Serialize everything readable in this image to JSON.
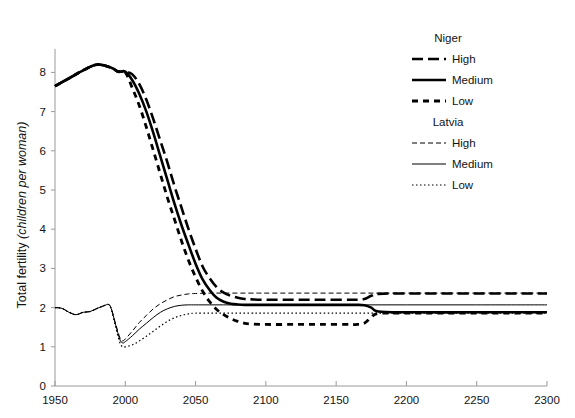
{
  "chart_data": {
    "type": "line",
    "title": "",
    "xlabel": "",
    "ylabel_main": "Total fertility ",
    "ylabel_italic": "(children per woman)",
    "xlim": [
      1950,
      2300
    ],
    "ylim": [
      0,
      8.6
    ],
    "xticks": [
      "1950",
      "2000",
      "2050",
      "2100",
      "2150",
      "2200",
      "2250",
      "2300"
    ],
    "xtick_values": [
      1950,
      2000,
      2050,
      2100,
      2150,
      2200,
      2250,
      2300
    ],
    "yticks": [
      "0",
      "1",
      "2",
      "3",
      "4",
      "5",
      "6",
      "7",
      "8"
    ],
    "ytick_values": [
      0,
      1,
      2,
      3,
      4,
      5,
      6,
      7,
      8
    ],
    "grid": false,
    "legend_position": "top-right",
    "series": [
      {
        "name": "Niger High",
        "group": "Niger",
        "variant": "High",
        "style": "long-dash-thick",
        "color": "#000000",
        "width": 2.6,
        "dash": "11 5",
        "x": [
          1950,
          1960,
          1970,
          1980,
          1990,
          1995,
          2000,
          2005,
          2010,
          2015,
          2020,
          2025,
          2030,
          2035,
          2040,
          2045,
          2050,
          2055,
          2060,
          2065,
          2070,
          2075,
          2080,
          2085,
          2090,
          2100,
          2120,
          2140,
          2160,
          2165,
          2170,
          2175,
          2180,
          2200,
          2250,
          2300
        ],
        "y": [
          7.65,
          7.85,
          8.05,
          8.2,
          8.12,
          8.02,
          8.02,
          7.95,
          7.7,
          7.3,
          6.8,
          6.25,
          5.7,
          5.1,
          4.55,
          4.0,
          3.5,
          3.05,
          2.75,
          2.52,
          2.38,
          2.3,
          2.25,
          2.22,
          2.21,
          2.2,
          2.2,
          2.2,
          2.2,
          2.2,
          2.22,
          2.3,
          2.35,
          2.36,
          2.36,
          2.36
        ]
      },
      {
        "name": "Niger Medium",
        "group": "Niger",
        "variant": "Medium",
        "style": "solid-thick",
        "color": "#000000",
        "width": 2.6,
        "dash": "none",
        "x": [
          1950,
          1960,
          1970,
          1980,
          1990,
          1995,
          2000,
          2005,
          2010,
          2015,
          2020,
          2025,
          2030,
          2035,
          2040,
          2045,
          2050,
          2055,
          2060,
          2065,
          2070,
          2075,
          2080,
          2085,
          2090,
          2100,
          2120,
          2140,
          2160,
          2165,
          2170,
          2175,
          2180,
          2200,
          2250,
          2300
        ],
        "y": [
          7.65,
          7.85,
          8.05,
          8.2,
          8.12,
          8.02,
          8.02,
          7.8,
          7.45,
          7.0,
          6.45,
          5.85,
          5.25,
          4.65,
          4.1,
          3.6,
          3.12,
          2.72,
          2.45,
          2.25,
          2.15,
          2.1,
          2.08,
          2.07,
          2.07,
          2.07,
          2.07,
          2.07,
          2.07,
          2.07,
          2.06,
          2.0,
          1.9,
          1.88,
          1.88,
          1.88
        ]
      },
      {
        "name": "Niger Low",
        "group": "Niger",
        "variant": "Low",
        "style": "short-dash-thick",
        "color": "#000000",
        "width": 2.8,
        "dash": "6 5",
        "x": [
          1950,
          1960,
          1970,
          1980,
          1990,
          1995,
          2000,
          2005,
          2010,
          2015,
          2020,
          2025,
          2030,
          2035,
          2040,
          2045,
          2050,
          2055,
          2060,
          2065,
          2070,
          2075,
          2080,
          2085,
          2090,
          2100,
          2120,
          2140,
          2160,
          2165,
          2170,
          2175,
          2180,
          2200,
          2250,
          2300
        ],
        "y": [
          7.65,
          7.85,
          8.05,
          8.2,
          8.12,
          8.02,
          8.0,
          7.6,
          7.15,
          6.6,
          6.0,
          5.4,
          4.8,
          4.25,
          3.7,
          3.2,
          2.78,
          2.42,
          2.15,
          1.95,
          1.82,
          1.72,
          1.65,
          1.6,
          1.58,
          1.57,
          1.57,
          1.57,
          1.57,
          1.57,
          1.6,
          1.75,
          1.85,
          1.86,
          1.86,
          1.86
        ]
      },
      {
        "name": "Latvia High",
        "group": "Latvia",
        "variant": "High",
        "style": "dash-thin",
        "color": "#000000",
        "width": 1.0,
        "dash": "5 3",
        "x": [
          1950,
          1955,
          1960,
          1965,
          1970,
          1975,
          1980,
          1985,
          1988,
          1990,
          1993,
          1996,
          1998,
          2000,
          2005,
          2010,
          2015,
          2020,
          2025,
          2030,
          2035,
          2040,
          2045,
          2050,
          2060,
          2070,
          2080,
          2090,
          2100,
          2150,
          2200,
          2250,
          2300
        ],
        "y": [
          2.0,
          1.98,
          1.88,
          1.82,
          1.88,
          1.9,
          1.98,
          2.05,
          2.08,
          1.98,
          1.6,
          1.25,
          1.15,
          1.2,
          1.4,
          1.62,
          1.8,
          1.97,
          2.1,
          2.2,
          2.28,
          2.32,
          2.35,
          2.36,
          2.37,
          2.37,
          2.37,
          2.37,
          2.37,
          2.37,
          2.37,
          2.37,
          2.37
        ]
      },
      {
        "name": "Latvia Medium",
        "group": "Latvia",
        "variant": "Medium",
        "style": "solid-thin",
        "color": "#000000",
        "width": 1.0,
        "dash": "none",
        "x": [
          1950,
          1955,
          1960,
          1965,
          1970,
          1975,
          1980,
          1985,
          1988,
          1990,
          1993,
          1996,
          1998,
          2000,
          2005,
          2010,
          2015,
          2020,
          2025,
          2030,
          2035,
          2040,
          2045,
          2050,
          2060,
          2070,
          2080,
          2090,
          2100,
          2150,
          2200,
          2250,
          2300
        ],
        "y": [
          2.0,
          1.98,
          1.88,
          1.82,
          1.88,
          1.9,
          1.98,
          2.05,
          2.08,
          1.98,
          1.58,
          1.2,
          1.1,
          1.13,
          1.28,
          1.45,
          1.6,
          1.75,
          1.88,
          1.97,
          2.03,
          2.06,
          2.07,
          2.07,
          2.07,
          2.07,
          2.07,
          2.07,
          2.07,
          2.07,
          2.07,
          2.07,
          2.07
        ]
      },
      {
        "name": "Latvia Low",
        "group": "Latvia",
        "variant": "Low",
        "style": "dotted-thin",
        "color": "#000000",
        "width": 1.2,
        "dash": "1.5 2.5",
        "x": [
          1950,
          1955,
          1960,
          1965,
          1970,
          1975,
          1980,
          1985,
          1988,
          1990,
          1993,
          1996,
          1998,
          2000,
          2005,
          2010,
          2015,
          2020,
          2025,
          2030,
          2035,
          2040,
          2045,
          2050,
          2060,
          2070,
          2080,
          2090,
          2100,
          2150,
          2200,
          2250,
          2300
        ],
        "y": [
          2.0,
          1.98,
          1.88,
          1.82,
          1.88,
          1.9,
          1.98,
          2.05,
          2.08,
          1.96,
          1.52,
          1.12,
          1.0,
          1.0,
          1.05,
          1.15,
          1.27,
          1.4,
          1.53,
          1.65,
          1.74,
          1.8,
          1.84,
          1.86,
          1.86,
          1.86,
          1.86,
          1.86,
          1.86,
          1.86,
          1.86,
          1.86,
          1.86
        ]
      }
    ]
  },
  "legend": {
    "groups": [
      {
        "heading": "Niger",
        "entries": [
          {
            "label": "High",
            "series": "Niger High"
          },
          {
            "label": "Medium",
            "series": "Niger Medium"
          },
          {
            "label": "Low",
            "series": "Niger Low"
          }
        ]
      },
      {
        "heading": "Latvia",
        "entries": [
          {
            "label": "High",
            "series": "Latvia High"
          },
          {
            "label": "Medium",
            "series": "Latvia Medium"
          },
          {
            "label": "Low",
            "series": "Latvia Low"
          }
        ]
      }
    ]
  },
  "colors": {
    "ink": "#000000",
    "axis": "#9a9a9a",
    "background": "#ffffff"
  }
}
